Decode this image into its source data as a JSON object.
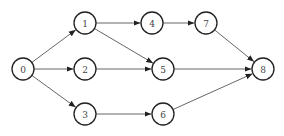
{
  "diagram": {
    "type": "directed-graph",
    "nodes": [
      {
        "id": "0",
        "label": "0"
      },
      {
        "id": "1",
        "label": "1"
      },
      {
        "id": "2",
        "label": "2"
      },
      {
        "id": "3",
        "label": "3"
      },
      {
        "id": "4",
        "label": "4"
      },
      {
        "id": "5",
        "label": "5"
      },
      {
        "id": "6",
        "label": "6"
      },
      {
        "id": "7",
        "label": "7"
      },
      {
        "id": "8",
        "label": "8"
      }
    ],
    "edges": [
      {
        "from": "0",
        "to": "1"
      },
      {
        "from": "0",
        "to": "2"
      },
      {
        "from": "0",
        "to": "3"
      },
      {
        "from": "1",
        "to": "4"
      },
      {
        "from": "1",
        "to": "5"
      },
      {
        "from": "2",
        "to": "5"
      },
      {
        "from": "3",
        "to": "6"
      },
      {
        "from": "4",
        "to": "7"
      },
      {
        "from": "5",
        "to": "8"
      },
      {
        "from": "6",
        "to": "8"
      },
      {
        "from": "7",
        "to": "8"
      }
    ]
  }
}
